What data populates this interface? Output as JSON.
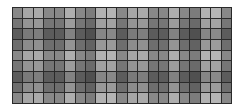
{
  "mosaic": {
    "rows": 9,
    "cols": 21,
    "border_color": "#2a2a2a",
    "row_base": [
      136,
      118,
      92,
      110,
      136,
      118,
      92,
      110,
      136
    ],
    "col_offset": [
      0,
      30,
      34,
      0,
      0,
      38,
      0,
      -12,
      42,
      44,
      0,
      30,
      34,
      0,
      0,
      38,
      0,
      -12,
      42,
      46,
      0
    ]
  }
}
